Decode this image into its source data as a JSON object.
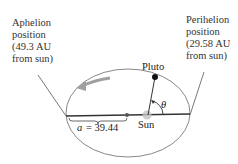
{
  "labels": {
    "aphelion": [
      "Aphelion",
      "position",
      "(49.3 AU",
      "from sun)"
    ],
    "perihelion": [
      "Perihelion",
      "position",
      "(29.58 AU",
      "from sun)"
    ],
    "pluto": "Pluto",
    "sun": "Sun",
    "theta": "θ",
    "semimajor_var": "a",
    "semimajor_value": "= 39.44"
  },
  "colors": {
    "ellipse": "#888888",
    "axis": "#333333",
    "arrow": "#9a9a9a",
    "sun_glow": "#bbbbbb",
    "pluto": "#111111"
  }
}
